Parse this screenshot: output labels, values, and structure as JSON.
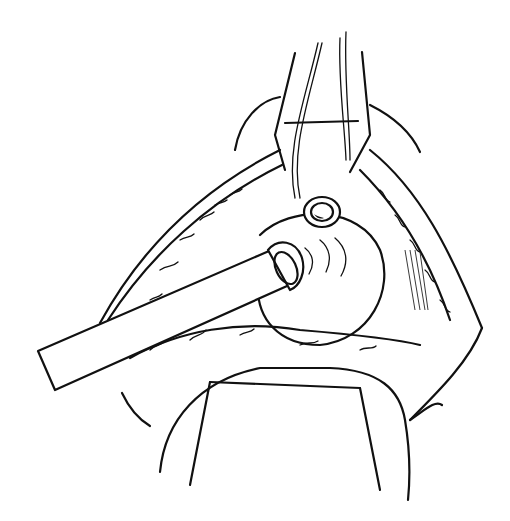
{
  "figure": {
    "kind": "line-art surgical illustration",
    "background": "#ffffff",
    "ink": "#111111",
    "elements": [
      "retractor-blades",
      "suture-threads",
      "incision-tissue-left",
      "incision-tissue-right",
      "spherical-organ",
      "catheter-tube",
      "cannulated-opening",
      "lower-retractor-drape"
    ]
  }
}
